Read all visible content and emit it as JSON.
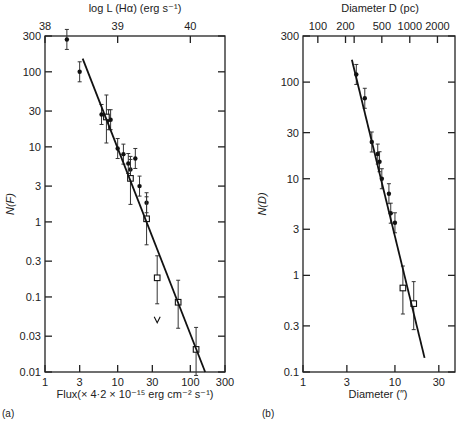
{
  "chart_data": [
    {
      "type": "scatter",
      "panel_label": "(a)",
      "xlabel": "Flux(× 4·2 × 10⁻¹⁵ erg cm⁻² s⁻¹)",
      "ylabel": "N(F)",
      "top_xlabel": "log L (Hα) (erg s⁻¹)",
      "xscale": "log",
      "yscale": "log",
      "xlim": [
        1,
        300
      ],
      "ylim": [
        0.01,
        300
      ],
      "x_ticks": [
        1,
        3,
        10,
        30,
        100,
        300
      ],
      "x_tick_labels": [
        "1",
        "3",
        "10",
        "30",
        "100",
        "300"
      ],
      "y_ticks": [
        0.01,
        0.03,
        0.1,
        0.3,
        1,
        3,
        10,
        30,
        100,
        300
      ],
      "y_tick_labels": [
        "0.01",
        "0.03",
        "0.1",
        "0.3",
        "1",
        "3",
        "10",
        "30",
        "100",
        "300"
      ],
      "top_ticks": [
        {
          "label": "38",
          "x": 1
        },
        {
          "label": "39",
          "x": 10
        },
        {
          "label": "40",
          "x": 100
        }
      ],
      "grid": false,
      "series": [
        {
          "name": "filled",
          "marker": "filled-circle",
          "x": [
            2.0,
            3.0,
            6.0,
            7.5,
            8.0,
            10.0,
            12.0,
            14.0,
            15.0,
            17.5,
            20.0,
            25.0
          ],
          "y": [
            270,
            100,
            27,
            23,
            23,
            9.5,
            8,
            6,
            5,
            7,
            3,
            1.8
          ]
        },
        {
          "name": "open",
          "marker": "open-square",
          "x": [
            7.0,
            15.0,
            25.0,
            35.0,
            68.0,
            120.0
          ],
          "y": [
            25,
            3.8,
            1.1,
            0.18,
            0.085,
            0.02
          ],
          "notes": "point at x=35 has downward arrow (upper limit)"
        },
        {
          "name": "fit",
          "type": "line",
          "x": [
            3.3,
            160
          ],
          "y": [
            150,
            0.01
          ]
        }
      ]
    },
    {
      "type": "scatter",
      "panel_label": "(b)",
      "xlabel": "Diameter (″)",
      "ylabel": "N(D)",
      "top_xlabel": "Diameter D (pc)",
      "xscale": "log",
      "yscale": "log",
      "xlim": [
        1,
        45
      ],
      "ylim": [
        0.1,
        300
      ],
      "x_ticks": [
        1,
        3,
        10,
        30
      ],
      "x_tick_labels": [
        "1",
        "3",
        "10",
        "30"
      ],
      "y_ticks": [
        0.1,
        0.3,
        1,
        3,
        10,
        30,
        100,
        300
      ],
      "y_tick_labels": [
        "0.1",
        "0.3",
        "1",
        "3",
        "10",
        "30",
        "100",
        "300"
      ],
      "top_ticks": [
        {
          "label": "100",
          "x": 1.45
        },
        {
          "label": "200",
          "x": 2.9
        },
        {
          "label": "",
          "x": 3.6
        },
        {
          "label": "500",
          "x": 7.2
        },
        {
          "label": "1000",
          "x": 14.5
        },
        {
          "label": "2000",
          "x": 29
        }
      ],
      "grid": false,
      "series": [
        {
          "name": "filled",
          "marker": "filled-circle",
          "x": [
            3.8,
            4.7,
            5.6,
            6.5,
            6.8,
            7.2,
            8.6,
            9.0,
            10.0
          ],
          "y": [
            120,
            68,
            24,
            18,
            15,
            10,
            7,
            4.4,
            3.5
          ]
        },
        {
          "name": "open",
          "marker": "open-square",
          "x": [
            12.2,
            16.0
          ],
          "y": [
            0.74,
            0.51
          ]
        },
        {
          "name": "fit",
          "type": "line",
          "x": [
            3.4,
            21
          ],
          "y": [
            170,
            0.14
          ]
        }
      ]
    }
  ],
  "labels": {
    "a_top_title": "log L (Hα) (erg s⁻¹)",
    "a_bottom_title": "Flux(× 4·2 × 10⁻¹⁵ erg cm⁻² s⁻¹)",
    "a_ylabel": "N(F)",
    "a_panel": "(a)",
    "b_top_title": "Diameter D (pc)",
    "b_bottom_title": "Diameter (″)",
    "b_ylabel": "N(D)",
    "b_panel": "(b)"
  }
}
